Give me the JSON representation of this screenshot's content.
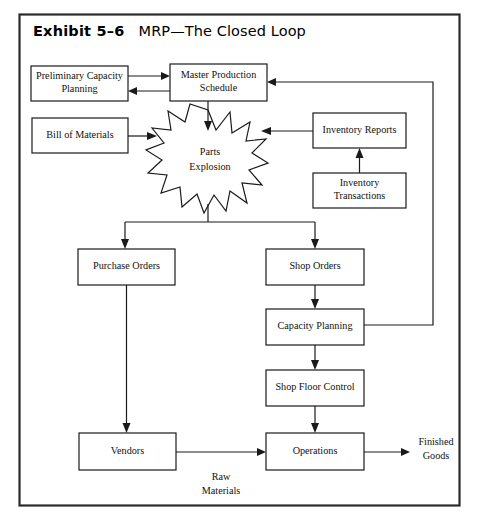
{
  "exhibit": {
    "number_label": "Exhibit 5–6",
    "caption": "MRP—The Closed Loop"
  },
  "colors": {
    "frame_border": "#2b2b2b",
    "box_border": "#1a1a1a",
    "box_fill": "#ffffff",
    "line": "#1a1a1a",
    "text": "#111111",
    "page_background": "#ffffff"
  },
  "diagram": {
    "type": "flowchart",
    "title": "MRP—The Closed Loop",
    "nodes": [
      {
        "id": "preliminary_capacity_planning",
        "shape": "rect",
        "line1": "Preliminary Capacity",
        "line2": "Planning",
        "x": 31,
        "y": 66,
        "w": 97,
        "h": 35
      },
      {
        "id": "master_production_schedule",
        "shape": "rect",
        "line1": "Master Production",
        "line2": "Schedule",
        "x": 170,
        "y": 64,
        "w": 97,
        "h": 37
      },
      {
        "id": "bill_of_materials",
        "shape": "rect",
        "line1": "Bill of Materials",
        "line2": "",
        "x": 32,
        "y": 118,
        "w": 96,
        "h": 35
      },
      {
        "id": "parts_explosion",
        "shape": "star",
        "line1": "Parts",
        "line2": "Explosion",
        "cx": 208,
        "cy": 160,
        "rx": 58,
        "ry": 50
      },
      {
        "id": "inventory_reports",
        "shape": "rect",
        "line1": "Inventory Reports",
        "line2": "",
        "x": 313,
        "y": 113,
        "w": 93,
        "h": 35
      },
      {
        "id": "inventory_transactions",
        "shape": "rect",
        "line1": "Inventory",
        "line2": "Transactions",
        "x": 313,
        "y": 173,
        "w": 93,
        "h": 35
      },
      {
        "id": "purchase_orders",
        "shape": "rect",
        "line1": "Purchase Orders",
        "line2": "",
        "x": 78,
        "y": 249,
        "w": 97,
        "h": 36
      },
      {
        "id": "shop_orders",
        "shape": "rect",
        "line1": "Shop Orders",
        "line2": "",
        "x": 266,
        "y": 249,
        "w": 98,
        "h": 36
      },
      {
        "id": "capacity_planning",
        "shape": "rect",
        "line1": "Capacity Planning",
        "line2": "",
        "x": 266,
        "y": 309,
        "w": 98,
        "h": 36
      },
      {
        "id": "shop_floor_control",
        "shape": "rect",
        "line1": "Shop Floor Control",
        "line2": "",
        "x": 266,
        "y": 370,
        "w": 98,
        "h": 36
      },
      {
        "id": "vendors",
        "shape": "rect",
        "line1": "Vendors",
        "line2": "",
        "x": 79,
        "y": 433,
        "w": 97,
        "h": 37
      },
      {
        "id": "operations",
        "shape": "rect",
        "line1": "Operations",
        "line2": "",
        "x": 266,
        "y": 433,
        "w": 98,
        "h": 37
      }
    ],
    "free_labels": [
      {
        "id": "finished_goods",
        "line1": "Finished",
        "line2": "Goods",
        "x": 436,
        "y": 443
      },
      {
        "id": "raw_materials",
        "line1": "Raw",
        "line2": "Materials",
        "x": 221,
        "y": 478
      }
    ],
    "edges": [
      {
        "id": "prelim-to-mps",
        "from": "preliminary_capacity_planning",
        "to": "master_production_schedule",
        "label": ""
      },
      {
        "id": "mps-to-prelim",
        "from": "master_production_schedule",
        "to": "preliminary_capacity_planning",
        "label": ""
      },
      {
        "id": "mps-to-parts",
        "from": "master_production_schedule",
        "to": "parts_explosion",
        "label": ""
      },
      {
        "id": "bom-to-parts",
        "from": "bill_of_materials",
        "to": "parts_explosion",
        "label": ""
      },
      {
        "id": "invreports-to-parts",
        "from": "inventory_reports",
        "to": "parts_explosion",
        "label": ""
      },
      {
        "id": "invtrans-to-invreports",
        "from": "inventory_transactions",
        "to": "inventory_reports",
        "label": ""
      },
      {
        "id": "parts-to-purchase-orders",
        "from": "parts_explosion",
        "to": "purchase_orders",
        "label": ""
      },
      {
        "id": "parts-to-shop-orders",
        "from": "parts_explosion",
        "to": "shop_orders",
        "label": ""
      },
      {
        "id": "shop-orders-to-capacity-planning",
        "from": "shop_orders",
        "to": "capacity_planning",
        "label": ""
      },
      {
        "id": "capacity-planning-to-mps-feedback",
        "from": "capacity_planning",
        "to": "master_production_schedule",
        "label": ""
      },
      {
        "id": "capacity-planning-to-shop-floor-control",
        "from": "capacity_planning",
        "to": "shop_floor_control",
        "label": ""
      },
      {
        "id": "shop-floor-control-to-operations",
        "from": "shop_floor_control",
        "to": "operations",
        "label": ""
      },
      {
        "id": "purchase-orders-to-vendors",
        "from": "purchase_orders",
        "to": "vendors",
        "label": ""
      },
      {
        "id": "vendors-to-operations",
        "from": "vendors",
        "to": "operations",
        "label": "Raw Materials"
      },
      {
        "id": "operations-to-finished-goods",
        "from": "operations",
        "to": "finished_goods",
        "label": "Finished Goods"
      }
    ]
  }
}
